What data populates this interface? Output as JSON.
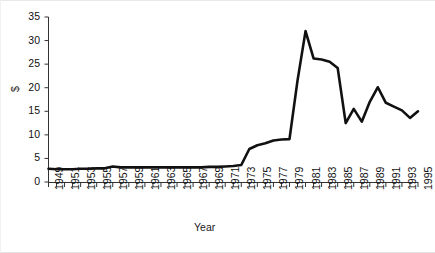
{
  "chart_data": {
    "type": "line",
    "title": "",
    "xlabel": "Year",
    "ylabel": "$",
    "xlim": [
      1949,
      1995
    ],
    "ylim": [
      0,
      35
    ],
    "grid": false,
    "legend": false,
    "y_ticks": [
      0,
      5,
      10,
      15,
      20,
      25,
      30,
      35
    ],
    "y_tick_labels": [
      "0",
      "5",
      "10",
      "15",
      "20",
      "25",
      "30",
      "35"
    ],
    "x_tick_labels": [
      "1949",
      "1951",
      "1953",
      "1955",
      "1957",
      "1959",
      "1961",
      "1963",
      "1965",
      "1967",
      "1969",
      "1971",
      "1973",
      "1975",
      "1977",
      "1979",
      "1981",
      "1983",
      "1985",
      "1987",
      "1989",
      "1991",
      "1993",
      "1995"
    ],
    "x": [
      1949,
      1950,
      1951,
      1952,
      1953,
      1954,
      1955,
      1956,
      1957,
      1958,
      1959,
      1960,
      1961,
      1962,
      1963,
      1964,
      1965,
      1966,
      1967,
      1968,
      1969,
      1970,
      1971,
      1972,
      1973,
      1974,
      1975,
      1976,
      1977,
      1978,
      1979,
      1980,
      1981,
      1982,
      1983,
      1984,
      1985,
      1986,
      1987,
      1988,
      1989,
      1990,
      1991,
      1992,
      1993,
      1994,
      1995
    ],
    "values": [
      2.8,
      2.7,
      2.7,
      2.7,
      2.8,
      2.8,
      2.9,
      2.9,
      3.3,
      3.1,
      3.1,
      3.1,
      3.1,
      3.1,
      3.1,
      3.1,
      3.1,
      3.1,
      3.1,
      3.1,
      3.2,
      3.2,
      3.3,
      3.4,
      3.6,
      7.0,
      7.8,
      8.2,
      8.8,
      9.0,
      9.1,
      21.5,
      32.0,
      26.2,
      26.0,
      25.5,
      24.2,
      12.5,
      15.5,
      12.8,
      17.0,
      20.1,
      16.8,
      16.0,
      15.2,
      13.6,
      15.0
    ],
    "series_name": "Price",
    "line_color": "#111111",
    "line_width": 2.6,
    "background_color": "#ffffff"
  }
}
